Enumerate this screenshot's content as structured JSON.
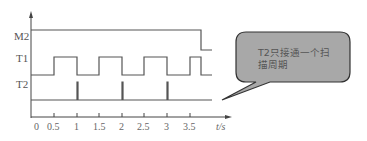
{
  "diagram": {
    "type": "timing-diagram",
    "signals": [
      {
        "name": "M2",
        "description": "high from t=0 until ~3.75, then low"
      },
      {
        "name": "T1",
        "description": "square wave, high 0.5-1, 1.5-2, 2.5-3, 3.5-3.75"
      },
      {
        "name": "T2",
        "description": "narrow pulses at t=1, 2, 3"
      }
    ],
    "x_axis": {
      "ticks": [
        "0",
        "0.5",
        "1",
        "1.5",
        "2",
        "2.5",
        "3",
        "3.5"
      ],
      "unit_label": "t/s"
    },
    "callout": {
      "text": "T2只接通一个扫描周期",
      "fill": "#a8a8a8",
      "stroke": "#333333"
    },
    "line_color": "#555555"
  }
}
